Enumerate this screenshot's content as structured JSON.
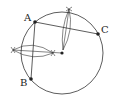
{
  "diagram": {
    "colors": {
      "stroke": "#333333",
      "background": "#ffffff"
    },
    "circle": {
      "cx": 62,
      "cy": 53,
      "r": 41
    },
    "points": [
      {
        "name": "A",
        "x": 35,
        "y": 22,
        "label_x": 24,
        "label_y": 21
      },
      {
        "name": "C",
        "x": 98,
        "y": 34,
        "label_x": 101,
        "label_y": 33
      },
      {
        "name": "B",
        "x": 31,
        "y": 79,
        "label_x": 20,
        "label_y": 86
      }
    ],
    "center": {
      "name": "O",
      "x": 62,
      "y": 53
    },
    "labels": {
      "A": "A",
      "B": "B",
      "C": "C"
    }
  }
}
